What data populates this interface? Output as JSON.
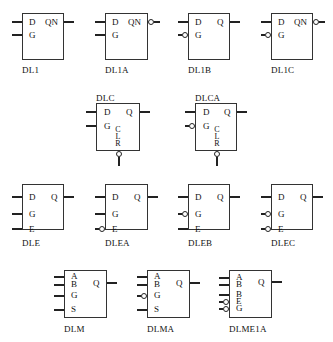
{
  "diagram": {
    "type": "logic-symbol-library",
    "components": [
      {
        "name": "DL1",
        "inputs": [
          {
            "label": "D",
            "inverted": false
          },
          {
            "label": "G",
            "inverted": false
          }
        ],
        "output": {
          "label": "QN",
          "inverted": false
        }
      },
      {
        "name": "DL1A",
        "inputs": [
          {
            "label": "D",
            "inverted": false
          },
          {
            "label": "G",
            "inverted": false
          }
        ],
        "output": {
          "label": "QN",
          "inverted": true
        }
      },
      {
        "name": "DL1B",
        "inputs": [
          {
            "label": "D",
            "inverted": false
          },
          {
            "label": "G",
            "inverted": true
          }
        ],
        "output": {
          "label": "Q",
          "inverted": false
        }
      },
      {
        "name": "DL1C",
        "inputs": [
          {
            "label": "D",
            "inverted": false
          },
          {
            "label": "G",
            "inverted": true
          }
        ],
        "output": {
          "label": "QN",
          "inverted": true
        }
      },
      {
        "name": "DLC",
        "inputs": [
          {
            "label": "D",
            "inverted": false
          },
          {
            "label": "G",
            "inverted": false
          }
        ],
        "output": {
          "label": "Q",
          "inverted": false
        },
        "bottom": {
          "label": [
            "C",
            "L",
            "R"
          ],
          "inverted": true
        }
      },
      {
        "name": "DLCA",
        "inputs": [
          {
            "label": "D",
            "inverted": false
          },
          {
            "label": "G",
            "inverted": true
          }
        ],
        "output": {
          "label": "Q",
          "inverted": false
        },
        "bottom": {
          "label": [
            "C",
            "L",
            "R"
          ],
          "inverted": true
        }
      },
      {
        "name": "DLE",
        "inputs": [
          {
            "label": "D",
            "inverted": false
          },
          {
            "label": "G",
            "inverted": false
          },
          {
            "label": "E",
            "inverted": false
          }
        ],
        "output": {
          "label": "Q",
          "inverted": false
        }
      },
      {
        "name": "DLEA",
        "inputs": [
          {
            "label": "D",
            "inverted": false
          },
          {
            "label": "G",
            "inverted": false
          },
          {
            "label": "E",
            "inverted": true
          }
        ],
        "output": {
          "label": "Q",
          "inverted": false
        }
      },
      {
        "name": "DLEB",
        "inputs": [
          {
            "label": "D",
            "inverted": false
          },
          {
            "label": "G",
            "inverted": true
          },
          {
            "label": "E",
            "inverted": false
          }
        ],
        "output": {
          "label": "Q",
          "inverted": false
        }
      },
      {
        "name": "DLEC",
        "inputs": [
          {
            "label": "D",
            "inverted": false
          },
          {
            "label": "G",
            "inverted": true
          },
          {
            "label": "E",
            "inverted": true
          }
        ],
        "output": {
          "label": "Q",
          "inverted": false
        }
      },
      {
        "name": "DLM",
        "inputs": [
          {
            "label": "A",
            "inverted": false
          },
          {
            "label": "B",
            "inverted": false
          },
          {
            "label": "G",
            "inverted": false
          },
          {
            "label": "S",
            "inverted": false
          }
        ],
        "output": {
          "label": "Q",
          "inverted": false
        }
      },
      {
        "name": "DLMA",
        "inputs": [
          {
            "label": "A",
            "inverted": false
          },
          {
            "label": "B",
            "inverted": false
          },
          {
            "label": "G",
            "inverted": true
          },
          {
            "label": "S",
            "inverted": false
          }
        ],
        "output": {
          "label": "Q",
          "inverted": false
        }
      },
      {
        "name": "DLME1A",
        "inputs": [
          {
            "label": "A",
            "inverted": false
          },
          {
            "label": "B",
            "inverted": false
          },
          {
            "label": "B",
            "inverted": false
          },
          {
            "label": "E",
            "inverted": true
          },
          {
            "label": "G",
            "inverted": true
          }
        ],
        "output": {
          "label": "Q",
          "inverted": false
        }
      }
    ]
  },
  "labels": {
    "dl1": {
      "name": "DL1",
      "d": "D",
      "g": "G",
      "out": "QN"
    },
    "dl1a": {
      "name": "DL1A",
      "d": "D",
      "g": "G",
      "out": "QN"
    },
    "dl1b": {
      "name": "DL1B",
      "d": "D",
      "g": "G",
      "out": "Q"
    },
    "dl1c": {
      "name": "DL1C",
      "d": "D",
      "g": "G",
      "out": "QN"
    },
    "dlc": {
      "name": "DLC",
      "d": "D",
      "g": "G",
      "out": "Q",
      "c": "C",
      "l": "L",
      "r": "R"
    },
    "dlca": {
      "name": "DLCA",
      "d": "D",
      "g": "G",
      "out": "Q",
      "c": "C",
      "l": "L",
      "r": "R"
    },
    "dle": {
      "name": "DLE",
      "d": "D",
      "g": "G",
      "e": "E",
      "out": "Q"
    },
    "dlea": {
      "name": "DLEA",
      "d": "D",
      "g": "G",
      "e": "E",
      "out": "Q"
    },
    "dleb": {
      "name": "DLEB",
      "d": "D",
      "g": "G",
      "e": "E",
      "out": "Q"
    },
    "dlec": {
      "name": "DLEC",
      "d": "D",
      "g": "G",
      "e": "E",
      "out": "Q"
    },
    "dlm": {
      "name": "DLM",
      "a": "A",
      "b": "B",
      "g": "G",
      "s": "S",
      "out": "Q"
    },
    "dlma": {
      "name": "DLMA",
      "a": "A",
      "b": "B",
      "g": "G",
      "s": "S",
      "out": "Q"
    },
    "dlme1a": {
      "name": "DLME1A",
      "a": "A",
      "b": "B",
      "b2": "B",
      "e": "E",
      "g": "G",
      "out": "Q"
    }
  }
}
